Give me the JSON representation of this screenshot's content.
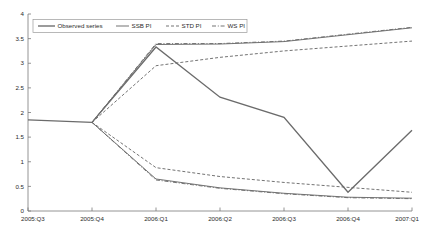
{
  "chart_data": {
    "type": "line",
    "title": "",
    "subtitle": "",
    "xlabel": "",
    "ylabel": "",
    "categories": [
      "2005:Q3",
      "2005:Q4",
      "2006:Q1",
      "2006:Q2",
      "2006:Q3",
      "2006:Q4",
      "2007:Q1"
    ],
    "xlim": [
      0,
      6
    ],
    "ylim": [
      0,
      4
    ],
    "yticks": [
      0,
      0.5,
      1,
      1.5,
      2,
      2.5,
      3,
      3.5,
      4
    ],
    "ytick_labels": [
      "0",
      "0.5",
      "1",
      "1.5",
      "2",
      "2.5",
      "3",
      "3.5",
      "4"
    ],
    "grid": false,
    "legend_position": "top-left",
    "series": [
      {
        "name": "Observed series",
        "style": "solid",
        "color": "#6b6b6b",
        "values": [
          1.85,
          1.8,
          3.33,
          2.31,
          1.9,
          0.38,
          1.64
        ]
      },
      {
        "name": "SSB PI",
        "style": "solid",
        "color": "#6b6b6b",
        "bound": "upper",
        "values": [
          null,
          1.8,
          3.38,
          3.39,
          3.44,
          3.58,
          3.72
        ]
      },
      {
        "name": "SSB PI",
        "style": "solid",
        "color": "#6b6b6b",
        "bound": "lower",
        "values": [
          null,
          1.8,
          0.65,
          0.47,
          0.36,
          0.28,
          0.26
        ]
      },
      {
        "name": "STD PI",
        "style": "dashed",
        "color": "#6b6b6b",
        "bound": "upper",
        "values": [
          null,
          1.8,
          2.95,
          3.12,
          3.25,
          3.35,
          3.45
        ]
      },
      {
        "name": "STD PI",
        "style": "dashed",
        "color": "#6b6b6b",
        "bound": "lower",
        "values": [
          null,
          1.8,
          0.88,
          0.7,
          0.58,
          0.48,
          0.38
        ]
      },
      {
        "name": "WS PI",
        "style": "dashdot",
        "color": "#6b6b6b",
        "bound": "upper",
        "values": [
          null,
          1.8,
          3.4,
          3.4,
          3.45,
          3.59,
          3.73
        ]
      },
      {
        "name": "WS PI",
        "style": "dashdot",
        "color": "#6b6b6b",
        "bound": "lower",
        "values": [
          null,
          1.8,
          0.63,
          0.46,
          0.35,
          0.27,
          0.25
        ]
      }
    ],
    "legend": [
      {
        "label": "Observed series",
        "style": "solid"
      },
      {
        "label": "SSB PI",
        "style": "solid"
      },
      {
        "label": "STD PI",
        "style": "dashed"
      },
      {
        "label": "WS PI",
        "style": "dashdot"
      }
    ]
  }
}
